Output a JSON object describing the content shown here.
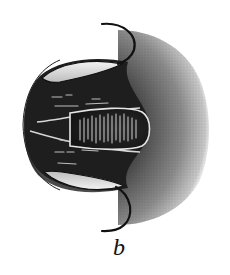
{
  "figure": {
    "panel_label": "b",
    "colors": {
      "background": "#ffffff",
      "dark_fill": "#1e1e1e",
      "mid_gray": "#555555",
      "shading_gray": "#8a8a8a",
      "highlight": "#e8e8e8",
      "outline": "#111111"
    }
  }
}
